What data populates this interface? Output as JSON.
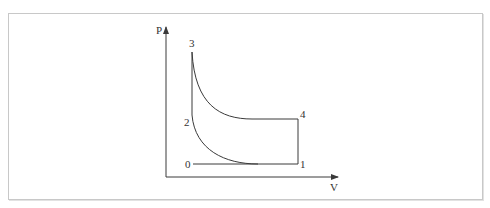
{
  "diagram": {
    "type": "P-V diagram",
    "axes": {
      "y_label": "P",
      "x_label": "V"
    },
    "points": [
      {
        "id": "0",
        "label": "0"
      },
      {
        "id": "1",
        "label": "1"
      },
      {
        "id": "2",
        "label": "2"
      },
      {
        "id": "3",
        "label": "3"
      },
      {
        "id": "4",
        "label": "4"
      }
    ],
    "colors": {
      "line": "#3a3a3a",
      "frame": "#c8c8c8",
      "background": "#ffffff"
    }
  }
}
